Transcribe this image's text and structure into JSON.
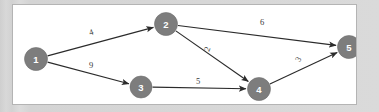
{
  "figure": {
    "kind": "directed-weighted-graph",
    "background_color": "#d6d6d6",
    "panel_color": "#ffffff",
    "panel_border_color": "#b4b4b4",
    "node_fill_color": "#7d7d7d",
    "node_text_color": "#ffffff",
    "edge_color": "#2b2b2b",
    "weight_text_color": "#3a3a3a"
  },
  "chart_data": {
    "type": "diagram",
    "title": "",
    "xlabel": "",
    "ylabel": "",
    "directed": true,
    "weighted": true,
    "nodes": [
      {
        "id": "n1",
        "label": "1",
        "x": 23,
        "y": 54,
        "r": 11.5
      },
      {
        "id": "n2",
        "label": "2",
        "x": 153,
        "y": 19,
        "r": 11.5
      },
      {
        "id": "n3",
        "label": "3",
        "x": 128,
        "y": 82,
        "r": 11.0
      },
      {
        "id": "n4",
        "label": "4",
        "x": 246,
        "y": 84,
        "r": 11.5
      },
      {
        "id": "n5",
        "label": "5",
        "x": 336,
        "y": 42,
        "r": 11.5
      }
    ],
    "edges": [
      {
        "id": "e12",
        "from": "n1",
        "to": "n2",
        "weight": "4",
        "label_x": 78,
        "label_y": 27,
        "label_rotate": -18
      },
      {
        "id": "e13",
        "from": "n1",
        "to": "n3",
        "weight": "9",
        "label_x": 78,
        "label_y": 60,
        "label_rotate": 0
      },
      {
        "id": "e25",
        "from": "n2",
        "to": "n5",
        "weight": "6",
        "label_x": 249,
        "label_y": 17,
        "label_rotate": 0
      },
      {
        "id": "e24",
        "from": "n2",
        "to": "n4",
        "weight": "2",
        "label_x": 194,
        "label_y": 44,
        "label_rotate": -68
      },
      {
        "id": "e34",
        "from": "n3",
        "to": "n4",
        "weight": "5",
        "label_x": 185,
        "label_y": 76,
        "label_rotate": 0
      },
      {
        "id": "e45",
        "from": "n4",
        "to": "n5",
        "weight": "3",
        "label_x": 285,
        "label_y": 54,
        "label_rotate": -58
      }
    ]
  }
}
